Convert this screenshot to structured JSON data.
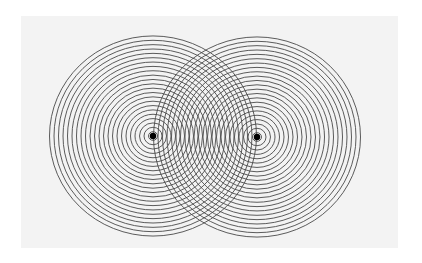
{
  "diagram": {
    "type": "two-source-interference",
    "background_color": "#ffffff",
    "panel_color": "#f3f3f3",
    "line_color": "#4a4a4a",
    "source_color": "#000000",
    "ring_count": 23,
    "ring_spacing_x": 4.5,
    "ring_spacing_y": 4.35,
    "sources": [
      {
        "name": "left-source",
        "cx": 153,
        "cy": 136,
        "dot_radius": 3.2
      },
      {
        "name": "right-source",
        "cx": 257,
        "cy": 137,
        "dot_radius": 3.2
      }
    ]
  }
}
